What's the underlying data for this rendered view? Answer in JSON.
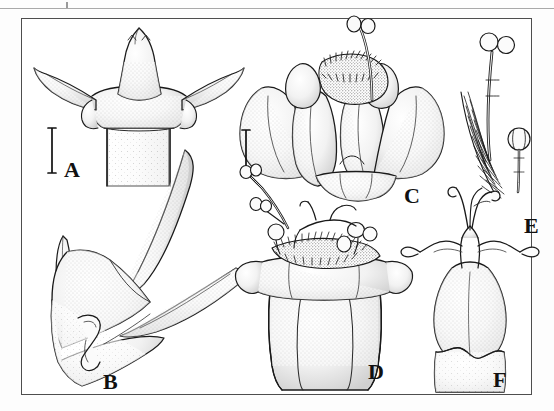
{
  "figure": {
    "kind": "botanical-line-art-plate",
    "technique": "stippled pen and ink",
    "panel_count": 6,
    "frame": {
      "border_color": "#4e4e4e",
      "background": "#ffffff"
    },
    "ink_color": "#1a1a1a",
    "stipple_color": "#5a5a5a"
  },
  "panels": [
    {
      "id": "A",
      "label": "A",
      "label_x": 64,
      "label_y": 159,
      "subject": "node with stipule and opposite branches",
      "description": "Stem node in face view with a pointed triangular interpetiolar stipule and two diverging lateral branches"
    },
    {
      "id": "B",
      "label": "B",
      "label_x": 103,
      "label_y": 371,
      "subject": "node in lateral view with spines",
      "description": "Lateral view of node bearing two long tapering spines and a small axillary bud"
    },
    {
      "id": "C",
      "label": "C",
      "label_x": 404,
      "label_y": 185,
      "subject": "flower, frontal view",
      "description": "Open flower seen from the front with spreading corolla lobes, bearded throat and exserted style"
    },
    {
      "id": "D",
      "label": "D",
      "label_x": 368,
      "label_y": 361,
      "subject": "dissected corolla tube",
      "description": "Corolla tube opened to expose the ring of hairs, inserted anthers and style"
    },
    {
      "id": "E",
      "label": "E",
      "label_x": 524,
      "label_y": 215,
      "subject": "stamens detail",
      "description": "Detail of two stamens with filaments and rounded anthers among throat hairs"
    },
    {
      "id": "F",
      "label": "F",
      "label_x": 493,
      "label_y": 369,
      "subject": "ovary with style and stigma lobes",
      "description": "Ovary and calyx with elongate style and recurved stigmatic branches"
    }
  ],
  "scale_bars": [
    {
      "id": "scale-bar-a",
      "for_panel": "A",
      "x": 48,
      "y": 128,
      "height": 45,
      "orientation": "vertical",
      "style": "I-beam bracket"
    },
    {
      "id": "scale-bar-c",
      "for_panel": "C",
      "x": 242,
      "y": 130,
      "height": 46,
      "orientation": "vertical",
      "style": "I-beam bracket"
    }
  ],
  "top_rule": {
    "visible": true,
    "color": "#a9a9a9"
  }
}
